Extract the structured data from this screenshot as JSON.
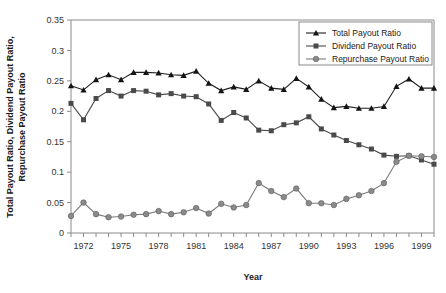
{
  "chart_data": {
    "type": "line",
    "title": "",
    "xlabel": "Year",
    "ylabel": "Total Payout Ratio, Dividend Payout Ratio, Repurchase Payout Ratio",
    "ylabel_line1": "Total Payout Ratio, Dividend Payout Ratio,",
    "ylabel_line2": "Repurchase Payout Ratio",
    "ylim": [
      0,
      0.35
    ],
    "xlim": [
      1971,
      2000
    ],
    "grid": false,
    "legend_position": "top-right",
    "ytick_labels": [
      "0",
      "0.05",
      "0.1",
      "0.15",
      "0.2",
      "0.25",
      "0.3",
      "0.35"
    ],
    "ytick_values": [
      0,
      0.05,
      0.1,
      0.15,
      0.2,
      0.25,
      0.3,
      0.35
    ],
    "xtick_labels": [
      "1972",
      "1975",
      "1978",
      "1981",
      "1984",
      "1987",
      "1990",
      "1993",
      "1996",
      "1999"
    ],
    "xtick_values": [
      1972,
      1975,
      1978,
      1981,
      1984,
      1987,
      1990,
      1993,
      1996,
      1999
    ],
    "x": [
      1971,
      1972,
      1973,
      1974,
      1975,
      1976,
      1977,
      1978,
      1979,
      1980,
      1981,
      1982,
      1983,
      1984,
      1985,
      1986,
      1987,
      1988,
      1989,
      1990,
      1991,
      1992,
      1993,
      1994,
      1995,
      1996,
      1997,
      1998,
      1999,
      2000
    ],
    "series": [
      {
        "name": "Total Payout Ratio",
        "marker": "triangle",
        "color": "#141414",
        "values": [
          0.242,
          0.235,
          0.252,
          0.26,
          0.252,
          0.264,
          0.264,
          0.263,
          0.26,
          0.259,
          0.266,
          0.246,
          0.234,
          0.24,
          0.236,
          0.25,
          0.238,
          0.236,
          0.254,
          0.24,
          0.22,
          0.206,
          0.208,
          0.205,
          0.205,
          0.208,
          0.241,
          0.253,
          0.238,
          0.238
        ]
      },
      {
        "name": "Dividend Payout Ratio",
        "marker": "square",
        "color": "#4a4a4a",
        "values": [
          0.213,
          0.186,
          0.221,
          0.234,
          0.225,
          0.234,
          0.233,
          0.227,
          0.229,
          0.225,
          0.224,
          0.212,
          0.185,
          0.198,
          0.189,
          0.169,
          0.168,
          0.178,
          0.181,
          0.191,
          0.171,
          0.161,
          0.152,
          0.145,
          0.138,
          0.128,
          0.126,
          0.127,
          0.12,
          0.113
        ]
      },
      {
        "name": "Repurchase Payout Ratio",
        "marker": "circle",
        "color": "#8a8a8a",
        "values": [
          0.028,
          0.05,
          0.031,
          0.026,
          0.027,
          0.03,
          0.031,
          0.036,
          0.031,
          0.034,
          0.041,
          0.032,
          0.048,
          0.042,
          0.046,
          0.082,
          0.069,
          0.059,
          0.073,
          0.049,
          0.049,
          0.046,
          0.056,
          0.062,
          0.069,
          0.082,
          0.117,
          0.127,
          0.126,
          0.125
        ]
      }
    ]
  },
  "legend": {
    "items": [
      {
        "label": "Total Payout Ratio"
      },
      {
        "label": "Dividend Payout Ratio"
      },
      {
        "label": "Repurchase Payout Ratio"
      }
    ]
  },
  "axes": {
    "x_title": "Year",
    "y_title_line1": "Total Payout Ratio, Dividend Payout Ratio,",
    "y_title_line2": "Repurchase Payout Ratio"
  }
}
